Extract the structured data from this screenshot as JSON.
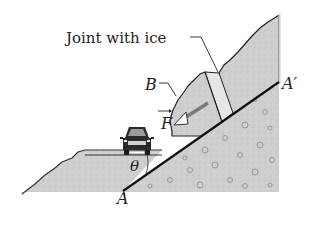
{
  "figure": {
    "labels": {
      "joint": "Joint with ice",
      "block": "B",
      "force": "F",
      "plane_top": "A′",
      "plane_bottom": "A",
      "angle": "θ"
    },
    "colors": {
      "rock_fill": "#c8c8c8",
      "outline": "#222222",
      "plane_line": "#111111",
      "force_arrow": "#7a7a7a",
      "background": "#ffffff"
    },
    "elements": [
      "cliff-rock-mass",
      "sliding-block-B",
      "ice-joint",
      "inclined-plane-AA'",
      "force-vector-F",
      "car",
      "road",
      "angle-theta"
    ]
  }
}
